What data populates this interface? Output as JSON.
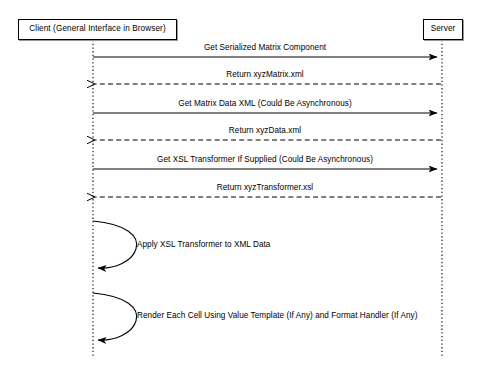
{
  "diagram": {
    "type": "uml-sequence-diagram",
    "background_color": "#ffffff",
    "line_color": "#000000",
    "participants": [
      {
        "id": "client",
        "label": "Client (General Interface in Browser)",
        "box": {
          "x": 18,
          "y": 19,
          "width": 159,
          "height": 21
        },
        "lifeline_x": 93,
        "lifeline_top": 40,
        "lifeline_bottom": 356
      },
      {
        "id": "server",
        "label": "Server",
        "box": {
          "x": 423,
          "y": 19,
          "width": 40,
          "height": 21
        },
        "lifeline_x": 442,
        "lifeline_top": 40,
        "lifeline_bottom": 356
      }
    ],
    "messages": [
      {
        "index": 1,
        "label": "Get Serialized Matrix Component",
        "from": "client",
        "to": "server",
        "direction": "right",
        "style": "solid",
        "y": 57,
        "label_x": 265,
        "label_y": 52
      },
      {
        "index": 2,
        "label": "Return xyzMatrix.xml",
        "from": "server",
        "to": "client",
        "direction": "left",
        "style": "dashed",
        "y": 84,
        "label_x": 265,
        "label_y": 79
      },
      {
        "index": 3,
        "label": "Get Matrix Data XML (Could Be Asynchronous)",
        "from": "client",
        "to": "server",
        "direction": "right",
        "style": "solid",
        "y": 113,
        "label_x": 265,
        "label_y": 108
      },
      {
        "index": 4,
        "label": "Return xyzData.xml",
        "from": "server",
        "to": "client",
        "direction": "left",
        "style": "dashed",
        "y": 140,
        "label_x": 265,
        "label_y": 135
      },
      {
        "index": 5,
        "label": "Get XSL Transformer If Supplied (Could Be Asynchronous)",
        "from": "client",
        "to": "server",
        "direction": "right",
        "style": "solid",
        "y": 169,
        "label_x": 265,
        "label_y": 164
      },
      {
        "index": 6,
        "label": "Return xyzTransformer.xsl",
        "from": "server",
        "to": "client",
        "direction": "left",
        "style": "dashed",
        "y": 197,
        "label_x": 265,
        "label_y": 192
      }
    ],
    "self_messages": [
      {
        "index": 1,
        "label": "Apply XSL Transformer to XML Data",
        "on": "client",
        "style": "solid",
        "start_y": 221,
        "end_y": 268,
        "bulge_x": 133,
        "label_x": 137,
        "label_y": 245
      },
      {
        "index": 2,
        "label": "Render Each Cell Using Value Template (If Any) and Format Handler (If Any)",
        "on": "client",
        "style": "solid",
        "start_y": 293,
        "end_y": 340,
        "bulge_x": 133,
        "label_x": 137,
        "label_y": 316
      }
    ]
  }
}
